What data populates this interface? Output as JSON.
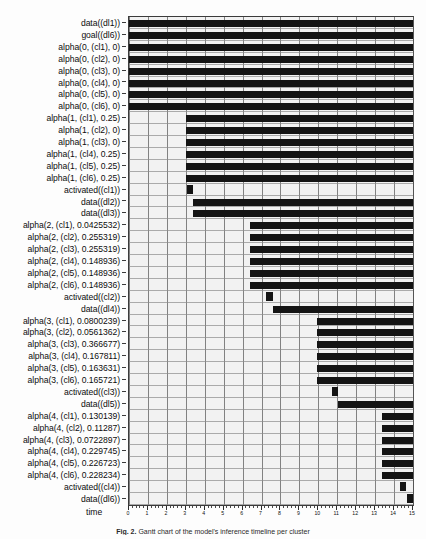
{
  "figure": {
    "xlabel": "time",
    "caption_prefix": "Fig. 2.",
    "caption_text": "Gantt chart of the model's inference timeline per cluster",
    "background": "#f2f2f2",
    "bar_color": "#141414",
    "grid_color": "#6f6f6f"
  },
  "chart_data": {
    "type": "bar",
    "orientation": "horizontal",
    "title": "",
    "xlabel": "time",
    "ylabel": "",
    "xlim": [
      0,
      15
    ],
    "xticks": [
      0,
      1,
      2,
      3,
      4,
      5,
      6,
      7,
      8,
      9,
      10,
      11,
      12,
      13,
      14,
      15
    ],
    "xtick_labels": [
      "0",
      "1",
      "2",
      "3",
      "4",
      "5",
      "6",
      "7",
      "8",
      "9",
      "10",
      "11",
      "12",
      "13",
      "14",
      "15"
    ],
    "grid": true,
    "legend": false,
    "note": "Each row is a proposition; the black span marks the time interval during which it holds.",
    "categories": [
      "data((dl1))",
      "goal((dl6))",
      "alpha(0, (cl1), 0)",
      "alpha(0, (cl2), 0)",
      "alpha(0, (cl3), 0)",
      "alpha(0, (cl4), 0)",
      "alpha(0, (cl5), 0)",
      "alpha(0, (cl6), 0)",
      "alpha(1, (cl1), 0.25)",
      "alpha(1, (cl2), 0)",
      "alpha(1, (cl3), 0)",
      "alpha(1, (cl4), 0.25)",
      "alpha(1, (cl5), 0.25)",
      "alpha(1, (cl6), 0.25)",
      "activated((cl1))",
      "data((dl2))",
      "data((dl3))",
      "alpha(2, (cl1), 0.0425532)",
      "alpha(2, (cl2), 0.255319)",
      "alpha(2, (cl3), 0.255319)",
      "alpha(2, (cl4), 0.148936)",
      "alpha(2, (cl5), 0.148936)",
      "alpha(2, (cl6), 0.148936)",
      "activated((cl2))",
      "data((dl4))",
      "alpha(3, (cl1), 0.0800239)",
      "alpha(3, (cl2), 0.0561362)",
      "alpha(3, (cl3), 0.366677)",
      "alpha(3, (cl4), 0.167811)",
      "alpha(3, (cl5), 0.163631)",
      "alpha(3, (cl6), 0.165721)",
      "activated((cl3))",
      "data((dl5))",
      "alpha(4, (cl1), 0.130139)",
      "alpha(4, (cl2), 0.11287)",
      "alpha(4, (cl3), 0.0722897)",
      "alpha(4, (cl4), 0.229745)",
      "alpha(4, (cl5), 0.226723)",
      "alpha(4, (cl6), 0.228234)",
      "activated((cl4))",
      "data((dl6))"
    ],
    "intervals": [
      {
        "label": "data((dl1))",
        "start": 0.0,
        "end": 15.0,
        "kind": "span"
      },
      {
        "label": "goal((dl6))",
        "start": 0.0,
        "end": 15.0,
        "kind": "span"
      },
      {
        "label": "alpha(0, (cl1), 0)",
        "start": 0.0,
        "end": 15.0,
        "kind": "span"
      },
      {
        "label": "alpha(0, (cl2), 0)",
        "start": 0.0,
        "end": 15.0,
        "kind": "span"
      },
      {
        "label": "alpha(0, (cl3), 0)",
        "start": 0.0,
        "end": 15.0,
        "kind": "span"
      },
      {
        "label": "alpha(0, (cl4), 0)",
        "start": 0.0,
        "end": 15.0,
        "kind": "span"
      },
      {
        "label": "alpha(0, (cl5), 0)",
        "start": 0.0,
        "end": 15.0,
        "kind": "span"
      },
      {
        "label": "alpha(0, (cl6), 0)",
        "start": 0.0,
        "end": 15.0,
        "kind": "span"
      },
      {
        "label": "alpha(1, (cl1), 0.25)",
        "start": 3.0,
        "end": 15.0,
        "kind": "span"
      },
      {
        "label": "alpha(1, (cl2), 0)",
        "start": 3.0,
        "end": 15.0,
        "kind": "span"
      },
      {
        "label": "alpha(1, (cl3), 0)",
        "start": 3.0,
        "end": 15.0,
        "kind": "span"
      },
      {
        "label": "alpha(1, (cl4), 0.25)",
        "start": 3.0,
        "end": 15.0,
        "kind": "span"
      },
      {
        "label": "alpha(1, (cl5), 0.25)",
        "start": 3.0,
        "end": 15.0,
        "kind": "span"
      },
      {
        "label": "alpha(1, (cl6), 0.25)",
        "start": 3.0,
        "end": 15.0,
        "kind": "span"
      },
      {
        "label": "activated((cl1))",
        "start": 3.05,
        "end": 3.4,
        "kind": "point"
      },
      {
        "label": "data((dl2))",
        "start": 3.4,
        "end": 15.0,
        "kind": "span"
      },
      {
        "label": "data((dl3))",
        "start": 3.4,
        "end": 15.0,
        "kind": "span"
      },
      {
        "label": "alpha(2, (cl1), 0.0425532)",
        "start": 6.4,
        "end": 15.0,
        "kind": "span"
      },
      {
        "label": "alpha(2, (cl2), 0.255319)",
        "start": 6.4,
        "end": 15.0,
        "kind": "span"
      },
      {
        "label": "alpha(2, (cl3), 0.255319)",
        "start": 6.4,
        "end": 15.0,
        "kind": "span"
      },
      {
        "label": "alpha(2, (cl4), 0.148936)",
        "start": 6.4,
        "end": 15.0,
        "kind": "span"
      },
      {
        "label": "alpha(2, (cl5), 0.148936)",
        "start": 6.4,
        "end": 15.0,
        "kind": "span"
      },
      {
        "label": "alpha(2, (cl6), 0.148936)",
        "start": 6.4,
        "end": 15.0,
        "kind": "span"
      },
      {
        "label": "activated((cl2))",
        "start": 7.25,
        "end": 7.6,
        "kind": "point"
      },
      {
        "label": "data((dl4))",
        "start": 7.6,
        "end": 15.0,
        "kind": "span"
      },
      {
        "label": "alpha(3, (cl1), 0.0800239)",
        "start": 9.95,
        "end": 15.0,
        "kind": "span"
      },
      {
        "label": "alpha(3, (cl2), 0.0561362)",
        "start": 9.95,
        "end": 15.0,
        "kind": "span"
      },
      {
        "label": "alpha(3, (cl3), 0.366677)",
        "start": 9.95,
        "end": 15.0,
        "kind": "span"
      },
      {
        "label": "alpha(3, (cl4), 0.167811)",
        "start": 9.95,
        "end": 15.0,
        "kind": "span"
      },
      {
        "label": "alpha(3, (cl5), 0.163631)",
        "start": 9.95,
        "end": 15.0,
        "kind": "span"
      },
      {
        "label": "alpha(3, (cl6), 0.165721)",
        "start": 9.95,
        "end": 15.0,
        "kind": "span"
      },
      {
        "label": "activated((cl3))",
        "start": 10.7,
        "end": 11.05,
        "kind": "point"
      },
      {
        "label": "data((dl5))",
        "start": 11.05,
        "end": 15.0,
        "kind": "span"
      },
      {
        "label": "alpha(4, (cl1), 0.130139)",
        "start": 13.35,
        "end": 15.0,
        "kind": "span"
      },
      {
        "label": "alpha(4, (cl2), 0.11287)",
        "start": 13.35,
        "end": 15.0,
        "kind": "span"
      },
      {
        "label": "alpha(4, (cl3), 0.0722897)",
        "start": 13.35,
        "end": 15.0,
        "kind": "span"
      },
      {
        "label": "alpha(4, (cl4), 0.229745)",
        "start": 13.35,
        "end": 15.0,
        "kind": "span"
      },
      {
        "label": "alpha(4, (cl5), 0.226723)",
        "start": 13.35,
        "end": 15.0,
        "kind": "span"
      },
      {
        "label": "alpha(4, (cl6), 0.228234)",
        "start": 13.35,
        "end": 15.0,
        "kind": "span"
      },
      {
        "label": "activated((cl4))",
        "start": 14.3,
        "end": 14.65,
        "kind": "point"
      },
      {
        "label": "data((dl6))",
        "start": 14.7,
        "end": 15.0,
        "kind": "point"
      }
    ]
  }
}
